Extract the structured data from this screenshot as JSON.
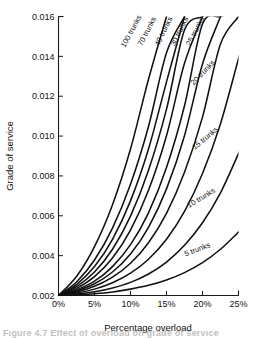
{
  "figure": {
    "caption_partial": "Figure 4.7   Effect of overload on grade of service"
  },
  "chart_data": {
    "type": "line",
    "title": "",
    "xlabel": "Percentage overload",
    "ylabel": "Grade of service",
    "xlim": [
      0,
      25
    ],
    "ylim": [
      0.002,
      0.016
    ],
    "grid": false,
    "legend": "inline-curve-labels",
    "xticks": [
      0,
      5,
      10,
      15,
      20,
      25
    ],
    "xtick_labels": [
      "0%",
      "5%",
      "10%",
      "15%",
      "20%",
      "25%"
    ],
    "yticks": [
      0.002,
      0.004,
      0.006,
      0.008,
      0.01,
      0.012,
      0.014,
      0.016
    ],
    "ytick_labels": [
      "0.002",
      "0.004",
      "0.006",
      "0.008",
      "0.010",
      "0.012",
      "0.014",
      "0.016"
    ],
    "x": [
      0,
      2.5,
      5,
      7.5,
      10,
      12.5,
      15,
      17.5,
      20,
      22.5,
      25
    ],
    "series": [
      {
        "name": "100 trunks",
        "label": "100 trunks",
        "label_x": 10.4,
        "label_y": 0.0152,
        "values": [
          0.002,
          0.00295,
          0.00445,
          0.00655,
          0.00935,
          0.01285,
          0.016,
          null,
          null,
          null,
          null
        ]
      },
      {
        "name": "70 trunks",
        "label": "",
        "values": [
          0.002,
          0.00268,
          0.00378,
          0.00538,
          0.00758,
          0.01048,
          0.01418,
          0.016,
          null,
          null,
          null
        ]
      },
      {
        "name": "60 trunks",
        "label": "70 trunks",
        "label_x": 12.6,
        "label_y": 0.0152,
        "values": [
          0.002,
          0.00255,
          0.00345,
          0.00482,
          0.00675,
          0.00935,
          0.01272,
          0.016,
          null,
          null,
          null
        ]
      },
      {
        "name": "50 trunks",
        "label": "",
        "values": [
          0.002,
          0.00245,
          0.00318,
          0.00432,
          0.00598,
          0.00828,
          0.01135,
          0.01532,
          0.016,
          null,
          null
        ]
      },
      {
        "name": "40 trunks",
        "label": "40 trunks",
        "label_x": 14.9,
        "label_y": 0.0152,
        "values": [
          0.002,
          0.00236,
          0.00295,
          0.00388,
          0.00528,
          0.00728,
          0.01002,
          0.01365,
          0.016,
          null,
          null
        ]
      },
      {
        "name": "30 trunks",
        "label": "30 trunks",
        "label_x": 17.1,
        "label_y": 0.0152,
        "values": [
          0.002,
          0.00228,
          0.00272,
          0.00345,
          0.00455,
          0.00615,
          0.00842,
          0.01152,
          0.01562,
          0.016,
          null
        ]
      },
      {
        "name": "25 trunks",
        "label": "25 trunks",
        "label_x": 19.3,
        "label_y": 0.0152,
        "values": [
          0.002,
          0.00223,
          0.00259,
          0.00318,
          0.00408,
          0.00542,
          0.00735,
          0.01002,
          0.01362,
          0.016,
          null
        ]
      },
      {
        "name": "20 trunks",
        "label": "20 trunks",
        "label_x": 20.3,
        "label_y": 0.0131,
        "values": [
          0.002,
          0.00218,
          0.00246,
          0.00292,
          0.00362,
          0.00465,
          0.00612,
          0.00818,
          0.01095,
          0.01462,
          0.016
        ]
      },
      {
        "name": "15 trunks",
        "label": "15 trunks",
        "label_x": 20.6,
        "label_y": 0.0098,
        "values": [
          0.002,
          0.00212,
          0.00232,
          0.00264,
          0.00312,
          0.00382,
          0.00482,
          0.00622,
          0.00812,
          0.01062,
          0.01388
        ]
      },
      {
        "name": "10 trunks",
        "label": "10 trunks",
        "label_x": 20.0,
        "label_y": 0.0068,
        "values": [
          0.002,
          0.00207,
          0.00219,
          0.00238,
          0.00266,
          0.00308,
          0.00368,
          0.00452,
          0.00565,
          0.00715,
          0.00912
        ]
      },
      {
        "name": "5 trunks",
        "label": "5 trunks",
        "label_x": 19.4,
        "label_y": 0.0042,
        "values": [
          0.002,
          0.00203,
          0.00209,
          0.00218,
          0.00232,
          0.00251,
          0.00278,
          0.00315,
          0.00365,
          0.00432,
          0.00518
        ]
      }
    ]
  }
}
